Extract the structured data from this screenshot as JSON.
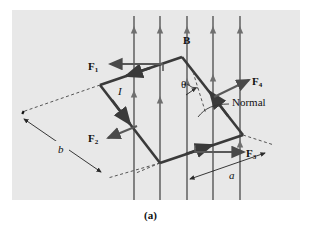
{
  "figure": {
    "caption": "(a)",
    "panel_color": "#e8e8e8",
    "background": "#ffffff",
    "line_color": "#4a4a4a",
    "dark_line_color": "#3a3a3a"
  },
  "labels": {
    "force_1": "F",
    "force_1_sub": "1",
    "force_2": "F",
    "force_2_sub": "2",
    "force_3": "F",
    "force_3_sub": "3",
    "force_4": "F",
    "force_4_sub": "4",
    "field": "B",
    "current": "I",
    "angle": "θ",
    "normal": "Normal",
    "side_a": "a",
    "side_b": "b"
  },
  "diagram_data": {
    "type": "physics-vector-diagram",
    "subject": "current-carrying rectangular loop in a uniform magnetic field",
    "loop_vertices": [
      {
        "name": "left",
        "x": 100,
        "y": 85
      },
      {
        "name": "top",
        "x": 182,
        "y": 57
      },
      {
        "name": "right",
        "x": 243,
        "y": 135
      },
      {
        "name": "bottom",
        "x": 160,
        "y": 163
      }
    ],
    "field_lines": {
      "count": 5,
      "orientation": "vertical",
      "direction": "upward",
      "x_positions": [
        134,
        160,
        187,
        213,
        240
      ],
      "y_top": 14,
      "y_bottom": 200
    },
    "forces": [
      {
        "label": "F1",
        "direction": "left",
        "applied_edge": "top-left"
      },
      {
        "label": "F2",
        "direction": "down-left",
        "applied_edge": "bottom-left"
      },
      {
        "label": "F3",
        "direction": "right",
        "applied_edge": "bottom-right"
      },
      {
        "label": "F4",
        "direction": "up-right",
        "applied_edge": "top-right"
      }
    ],
    "dimensions": [
      {
        "label": "b",
        "type": "double-headed-arrow",
        "edge": "long-side"
      },
      {
        "label": "a",
        "type": "double-headed-arrow",
        "edge": "short-side"
      }
    ],
    "angle_marked": "theta between B field and normal to loop"
  }
}
